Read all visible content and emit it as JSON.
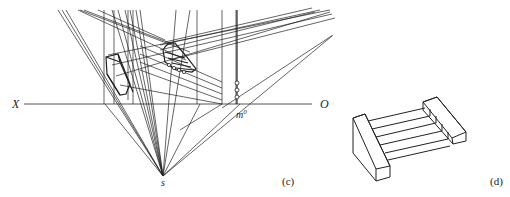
{
  "figure_c": {
    "caption": "(c)",
    "labels": {
      "x_axis": "X",
      "o_axis": "O",
      "station_point": "s",
      "measuring_point": "m",
      "measuring_point_sup": "0"
    }
  },
  "figure_d": {
    "caption": "(d)"
  },
  "colors": {
    "line": "#222222",
    "ground_line": "#555555",
    "background": "#ffffff"
  }
}
